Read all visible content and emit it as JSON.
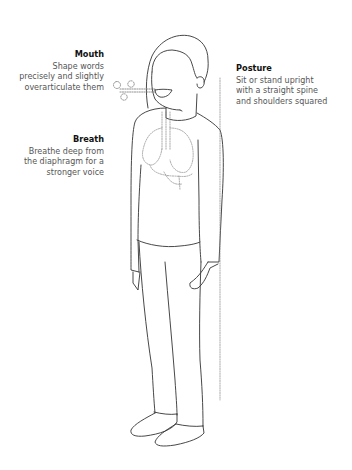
{
  "annotations": {
    "mouth": {
      "title": "Mouth",
      "description_lines": [
        "Shape words",
        "precisely and slightly",
        "overarticulate them"
      ]
    },
    "breath": {
      "title": "Breath",
      "description_lines": [
        "Breathe deep from",
        "the diaphragm for a",
        "stronger voice"
      ]
    },
    "posture": {
      "title": "Posture",
      "description_lines": [
        "Sit or stand upright",
        "with a straight spine",
        "and shoulders squared"
      ]
    }
  },
  "colors": {
    "outline": "#333333",
    "dashed": "#777777",
    "title_text": "#111111",
    "body_text": "#555555"
  }
}
